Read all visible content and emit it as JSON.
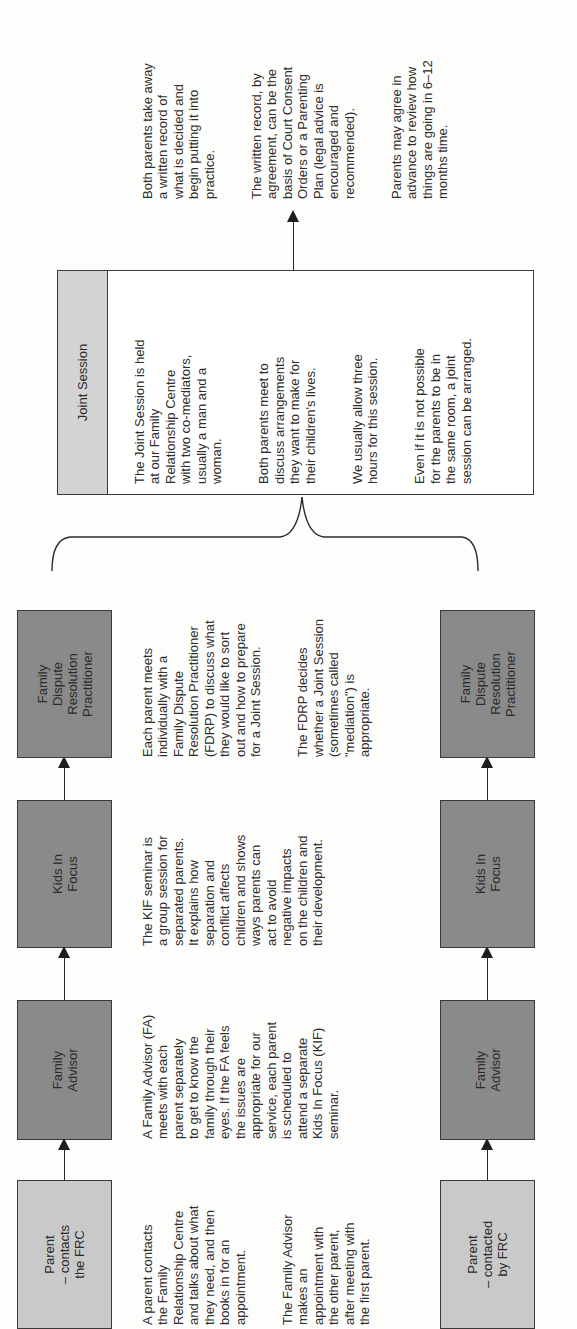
{
  "document": {
    "orientation": "rotated-90-ccw",
    "flow": {
      "top_track": {
        "boxes": [
          {
            "id": "parent",
            "label": "Parent\n– contacts\nthe FRC",
            "shade": "light"
          },
          {
            "id": "family-advisor",
            "label": "Family\nAdvisor",
            "shade": "dark"
          },
          {
            "id": "kids-in-focus",
            "label": "Kids In\nFocus",
            "shade": "dark"
          },
          {
            "id": "fdrp",
            "label": "Family\nDispute\nResolution\nPractitioner",
            "shade": "dark"
          }
        ]
      },
      "bottom_track": {
        "boxes": [
          {
            "id": "parent",
            "label": "Parent\n– contacted\nby FRC",
            "shade": "light"
          },
          {
            "id": "family-advisor",
            "label": "Family\nAdvisor",
            "shade": "dark"
          },
          {
            "id": "kids-in-focus",
            "label": "Kids In\nFocus",
            "shade": "dark"
          },
          {
            "id": "fdrp",
            "label": "Family\nDispute\nResolution\nPractitioner",
            "shade": "dark"
          }
        ]
      }
    },
    "descriptions": {
      "parent": [
        "A parent contacts\nthe Family\nRelationship Centre\nand talks about what\nthey need, and then\nbooks in for an\nappointment.",
        "The Family Advisor\nmakes an\nappointment with\nthe other parent,\nafter meeting with\nthe first parent."
      ],
      "family_advisor": [
        "A Family Advisor (FA)\nmeets with each\nparent separately\nto get to know the\nfamily through their\neyes. If the FA feels\nthe issues are\nappropriate for our\nservice, each parent\nis scheduled to\nattend a separate\nKids In Focus (KIF)\nseminar."
      ],
      "kids_in_focus": [
        "The KIF seminar is\na group session for\nseparated parents.\nIt explains how\nseparation and\nconflict affects\nchildren and shows\nways parents can\nact to avoid\nnegative impacts\non the children and\ntheir development."
      ],
      "fdrp": [
        "Each parent meets\nindividually with a\nFamily Dispute\nResolution Practitioner\n(FDRP) to discuss what\nthey would like to sort\nout and how to prepare\nfor a Joint Session.",
        "The FDRP decides\nwhether a Joint Session\n(sometimes called\n\"mediation\") is\nappropriate."
      ]
    },
    "joint_session": {
      "title": "Joint Session",
      "paragraphs": [
        "The Joint Session is held\nat our Family\nRelationship Centre\nwith two co-mediators,\nusually a man and a\nwoman.",
        "Both parents meet to\ndiscuss arrangements\nthey want to make for\ntheir children's lives.",
        "We usually allow three\nhours for this session.",
        "Even if it is not possible\nfor the parents to be in\nthe same room, a joint\nsession can be arranged."
      ]
    },
    "outcome": {
      "paragraphs": [
        "Both parents take away\na written record of\nwhat is decided and\nbegin putting it into\npractice.",
        "The written record, by\nagreement, can be the\nbasis of Court Consent\nOrders or a Parenting\nPlan (legal advice is\nencouraged and\nrecommended).",
        "Parents may agree in\nadvance to review how\nthings are going in 6–12\nmonths time."
      ]
    },
    "colors": {
      "light_box": "#c9c9c9",
      "dark_box": "#8a8a8a",
      "joint_header": "#d4d4d4",
      "line": "#2a2a2a",
      "text": "#2e2e2e",
      "paper": "#fdfdfc"
    }
  }
}
